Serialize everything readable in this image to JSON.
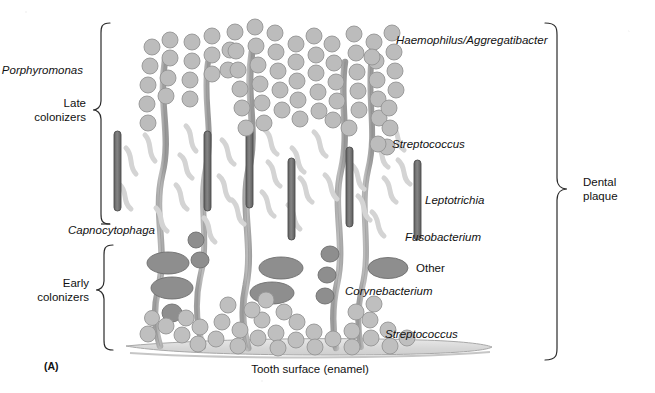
{
  "figure": {
    "panel_label": "(A)",
    "caption_bottom": "Tooth surface (enamel)",
    "title_semantic": "Dental plaque biofilm structure"
  },
  "brackets": {
    "left": [
      {
        "id": "late-colonizers",
        "label_line1": "Late",
        "label_line2": "colonizers"
      },
      {
        "id": "early-colonizers",
        "label_line1": "Early",
        "label_line2": "colonizers"
      }
    ],
    "right": [
      {
        "id": "dental-plaque",
        "label_line1": "Dental",
        "label_line2": "plaque"
      }
    ]
  },
  "labels_left": [
    {
      "id": "porphyromonas",
      "text": "Porphyromonas",
      "style": "italic"
    },
    {
      "id": "capnocytophaga",
      "text": "Capnocytophaga",
      "style": "italic"
    }
  ],
  "labels_right": [
    {
      "id": "haemophilus-aggregatibacter",
      "text": "Haemophilus/Aggregatibacter",
      "style": "italic"
    },
    {
      "id": "streptococcus-upper",
      "text": "Streptococcus",
      "style": "italic"
    },
    {
      "id": "leptotrichia",
      "text": "Leptotrichia",
      "style": "italic"
    },
    {
      "id": "fusobacterium",
      "text": "Fusobacterium",
      "style": "italic"
    },
    {
      "id": "other",
      "text": "Other",
      "style": "plain"
    },
    {
      "id": "corynebacterium",
      "text": "Corynebacterium",
      "style": "italic"
    },
    {
      "id": "streptococcus-lower",
      "text": "Streptococcus",
      "style": "italic"
    }
  ],
  "colors": {
    "background": "#ffffff",
    "line": "#2b2b2b",
    "coccus_fill": "#b9b9b9",
    "coccus_stroke": "#8f8f8f",
    "coccus_light_fill": "#c9c9c9",
    "filament_fill": "#a6a6a6",
    "filament_stroke": "#7d7d7d",
    "rod_dark_fill": "#6e6e6e",
    "rod_dark_stroke": "#4a4a4a",
    "wavy_light_fill": "#d2d2d2",
    "wavy_light_stroke": "#bdbdbd",
    "ellipse_other_fill": "#8e8e8e",
    "ellipse_other_stroke": "#6f6f6f",
    "enamel_fill": "#dedede",
    "enamel_stroke": "#a8a8a8"
  },
  "legend_glyphs": [
    {
      "id": "glyph-coccus",
      "shape": "circle",
      "meaning": "coccus"
    },
    {
      "id": "glyph-rod-dark",
      "shape": "rod",
      "meaning": "dark rod"
    },
    {
      "id": "glyph-filament",
      "shape": "filament",
      "meaning": "filament"
    },
    {
      "id": "glyph-wavy",
      "shape": "wavy",
      "meaning": "curved rod"
    },
    {
      "id": "glyph-ellipse",
      "shape": "ellipse",
      "meaning": "other ellipse"
    }
  ]
}
